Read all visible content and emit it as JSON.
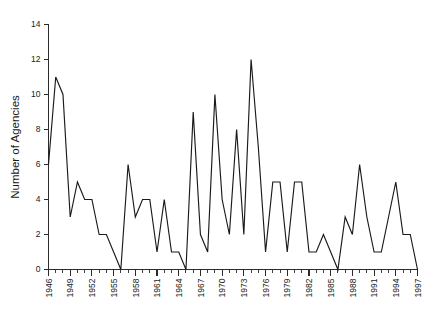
{
  "chart_data": {
    "type": "line",
    "title": "",
    "subtitle": "",
    "xlabel": "",
    "ylabel": "Number of Agencies",
    "xlim": [
      1946,
      1997
    ],
    "ylim": [
      0,
      14
    ],
    "grid": false,
    "legend": false,
    "legend_position": "none",
    "line_color": "#1a1a1a",
    "axis_color": "#2b2b2b",
    "y_ticks": [
      0,
      2,
      4,
      6,
      8,
      10,
      12,
      14
    ],
    "y_tick_labels": [
      "0",
      "2",
      "4",
      "6",
      "8",
      "10",
      "12",
      "14"
    ],
    "x_tick_labels": [
      "1946",
      "1949",
      "1952",
      "1955",
      "1958",
      "1961",
      "1964",
      "1967",
      "1970",
      "1973",
      "1976",
      "1979",
      "1982",
      "1985",
      "1988",
      "1991",
      "1994",
      "1997"
    ],
    "x_tick_label_years": [
      1946,
      1949,
      1952,
      1955,
      1958,
      1961,
      1964,
      1967,
      1970,
      1973,
      1976,
      1979,
      1982,
      1985,
      1988,
      1991,
      1994,
      1997
    ],
    "x_minor_tick_interval": 1,
    "x_major_tick_interval": 3,
    "x": [
      1946,
      1947,
      1948,
      1949,
      1950,
      1951,
      1952,
      1953,
      1954,
      1955,
      1956,
      1957,
      1958,
      1959,
      1960,
      1961,
      1962,
      1963,
      1964,
      1965,
      1966,
      1967,
      1968,
      1969,
      1970,
      1971,
      1972,
      1973,
      1974,
      1975,
      1976,
      1977,
      1978,
      1979,
      1980,
      1981,
      1982,
      1983,
      1984,
      1985,
      1986,
      1987,
      1988,
      1989,
      1990,
      1991,
      1992,
      1993,
      1994,
      1995,
      1996,
      1997
    ],
    "values": [
      6,
      11,
      10,
      3,
      5,
      4,
      4,
      2,
      2,
      1,
      0,
      6,
      3,
      4,
      4,
      1,
      4,
      1,
      1,
      0,
      9,
      2,
      1,
      10,
      4,
      2,
      8,
      2,
      12,
      7,
      1,
      5,
      5,
      1,
      5,
      5,
      1,
      1,
      2,
      1,
      0,
      3,
      2,
      6,
      3,
      1,
      1,
      3,
      5,
      2,
      2,
      0
    ],
    "series": [
      {
        "name": "Number of Agencies",
        "values": [
          6,
          11,
          10,
          3,
          5,
          4,
          4,
          2,
          2,
          1,
          0,
          6,
          3,
          4,
          4,
          1,
          4,
          1,
          1,
          0,
          9,
          2,
          1,
          10,
          4,
          2,
          8,
          2,
          12,
          7,
          1,
          5,
          5,
          1,
          5,
          5,
          1,
          1,
          2,
          1,
          0,
          3,
          2,
          6,
          3,
          1,
          1,
          3,
          5,
          2,
          2,
          0
        ]
      }
    ]
  }
}
